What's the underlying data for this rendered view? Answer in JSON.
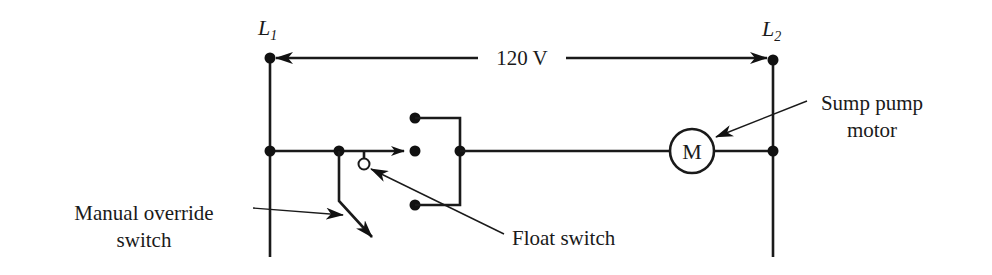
{
  "diagram": {
    "type": "ladder-schematic",
    "lines": {
      "left": {
        "label": "L",
        "subscript": "1"
      },
      "right": {
        "label": "L",
        "subscript": "2"
      },
      "voltage": "120 V"
    },
    "motor": {
      "symbol": "M",
      "label_line1": "Sump pump",
      "label_line2": "motor"
    },
    "float_switch": {
      "label": "Float switch"
    },
    "manual_override": {
      "label_line1": "Manual override",
      "label_line2": "switch"
    },
    "colors": {
      "stroke": "#1a1a1a",
      "background": "#ffffff"
    }
  }
}
